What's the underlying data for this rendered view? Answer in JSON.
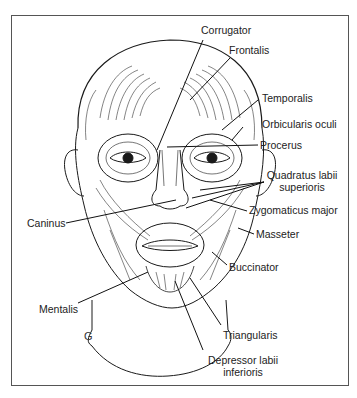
{
  "figure": {
    "type": "anatomical-illustration",
    "corner_mark": "G"
  },
  "labels": {
    "corrugator": "Corrugator",
    "frontalis": "Frontalis",
    "temporalis": "Temporalis",
    "orbicularis_oculi": "Orbicularis oculi",
    "procerus": "Procerus",
    "quadratus_line1": "Quadratus labii",
    "quadratus_line2": "superioris",
    "zygomaticus_major": "Zygomaticus major",
    "caninus": "Caninus",
    "masseter": "Masseter",
    "buccinator": "Buccinator",
    "mentalis": "Mentalis",
    "triangularis": "Triangularis",
    "depressor_line1": "Depressor labii",
    "depressor_line2": "inferioris"
  },
  "colors": {
    "ink": "#1a1a1a",
    "frame": "#555555",
    "background": "#ffffff"
  }
}
